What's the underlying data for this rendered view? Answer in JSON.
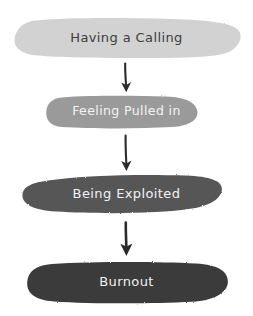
{
  "diagram": {
    "type": "vertical-flowchart",
    "style": "hand-drawn",
    "background_color": "#ffffff",
    "direction": "top-to-bottom",
    "node_count": 4,
    "arrow_count": 3,
    "nodes": [
      {
        "id": "having-a-calling",
        "label": "Having a Calling",
        "order": 1,
        "fill_color": "#d2d2d2",
        "text_color": "#3d3d3d",
        "shape": "blob-pill",
        "x": 14,
        "y": 18,
        "width": 226,
        "height": 40
      },
      {
        "id": "feeling-pulled-in",
        "label": "Feeling Pulled in",
        "order": 2,
        "fill_color": "#9a9a9a",
        "text_color": "#f4f4f4",
        "shape": "blob-pill",
        "x": 46,
        "y": 96,
        "width": 152,
        "height": 32
      },
      {
        "id": "being-exploited",
        "label": "Being Exploited",
        "order": 3,
        "fill_color": "#575757",
        "text_color": "#f2f2f2",
        "shape": "blob-pill",
        "x": 22,
        "y": 175,
        "width": 200,
        "height": 38
      },
      {
        "id": "burnout",
        "label": "Burnout",
        "order": 4,
        "fill_color": "#3a3a3a",
        "text_color": "#f0f0f0",
        "shape": "blob-pill",
        "x": 27,
        "y": 262,
        "width": 201,
        "height": 41
      }
    ],
    "arrows": [
      {
        "id": "arrow-1",
        "from": "having-a-calling",
        "to": "feeling-pulled-in",
        "color": "#2b2b2b",
        "x": 126,
        "y_start": 63,
        "y_end": 91
      },
      {
        "id": "arrow-2",
        "from": "feeling-pulled-in",
        "to": "being-exploited",
        "color": "#2b2b2b",
        "x": 126,
        "y_start": 135,
        "y_end": 170
      },
      {
        "id": "arrow-3",
        "from": "being-exploited",
        "to": "burnout",
        "color": "#2b2b2b",
        "x": 126,
        "y_start": 222,
        "y_end": 256
      }
    ]
  }
}
